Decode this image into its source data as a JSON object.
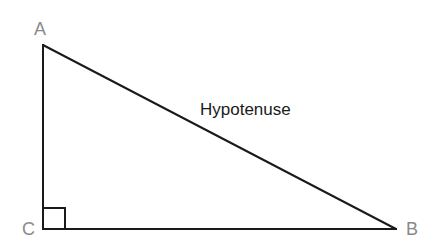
{
  "diagram": {
    "type": "right-triangle",
    "vertices": {
      "A": {
        "label": "A",
        "x": 43,
        "y": 45
      },
      "B": {
        "label": "B",
        "x": 396,
        "y": 229
      },
      "C": {
        "label": "C",
        "x": 43,
        "y": 229
      }
    },
    "right_angle_at": "C",
    "labels": {
      "vertex_a": "A",
      "vertex_b": "B",
      "vertex_c": "C",
      "hypotenuse": "Hypotenuse"
    },
    "colors": {
      "line": "#1a1a1a",
      "vertex_label": "#8a8a8a",
      "side_label": "#1a1a1a",
      "background": "#ffffff"
    }
  }
}
